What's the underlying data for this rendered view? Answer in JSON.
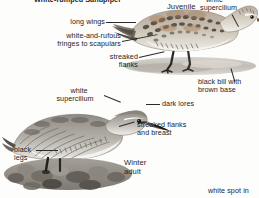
{
  "plate": {
    "title_partial": "White-rumped Sandpiper",
    "background_color": "#fdfdfc",
    "text_color": "#1d1d1d",
    "leader_color": "#2b2b2b"
  },
  "figures": [
    {
      "id": "juvenile",
      "name_label": "Juvenile",
      "description": "standing sandpiper on wet mud, upperparts with rufous and white scapular fringes, long wings projecting past tail"
    },
    {
      "id": "winter-adult",
      "name_label": "Winter\nadult",
      "name_line1": "Winter",
      "name_line2": "adult",
      "description": "grey winter-plumage sandpiper crouched on shoreline stones"
    }
  ],
  "annotations": [
    {
      "id": "long-wings",
      "text": "long wings",
      "target": "juvenile"
    },
    {
      "id": "white-and-rufous",
      "text": "white-and-rufous\nfringes to scapulars",
      "line1": "white-and-rufous",
      "line2": "fringes to scapulars",
      "target": "juvenile"
    },
    {
      "id": "streaked-flanks",
      "text": "streaked\nflanks",
      "line1": "streaked",
      "line2": "flanks",
      "target": "juvenile"
    },
    {
      "id": "white-supercilium-juv",
      "text": "white\nsupercilium",
      "line1": "white",
      "line2": "supercilium",
      "target": "juvenile"
    },
    {
      "id": "black-bill",
      "text": "black bill with\nbrown base",
      "line1": "black bill with",
      "line2": "brown base",
      "target": "juvenile"
    },
    {
      "id": "white-supercilium",
      "text": "white\nsupercilium",
      "line1": "white",
      "line2": "supercilium",
      "target": "winter-adult"
    },
    {
      "id": "dark-lores",
      "text": "dark lores",
      "target": "winter-adult"
    },
    {
      "id": "streaked-flanks-breast",
      "text": "streaked flanks\nand breast",
      "line1": "streaked flanks",
      "line2": "and breast",
      "target": "winter-adult"
    },
    {
      "id": "black-legs",
      "text": "black\nlegs",
      "line1": "black",
      "line2": "legs",
      "target": "winter-adult"
    },
    {
      "id": "white-spot",
      "text": "white spot in",
      "target": "winter-adult"
    }
  ]
}
